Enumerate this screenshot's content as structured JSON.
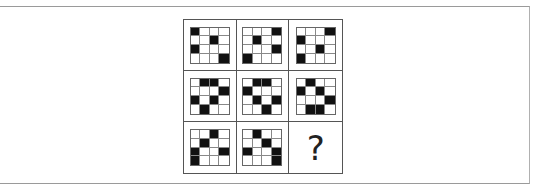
{
  "puzzle": {
    "type": "3x3 matrix reasoning",
    "grid_size": 4,
    "cells": [
      {
        "pattern": [
          [
            1,
            0,
            0,
            0
          ],
          [
            0,
            0,
            1,
            0
          ],
          [
            1,
            0,
            0,
            0
          ],
          [
            0,
            0,
            0,
            1
          ]
        ]
      },
      {
        "pattern": [
          [
            0,
            0,
            0,
            1
          ],
          [
            0,
            1,
            0,
            0
          ],
          [
            0,
            0,
            0,
            1
          ],
          [
            1,
            0,
            0,
            0
          ]
        ]
      },
      {
        "pattern": [
          [
            0,
            0,
            0,
            1
          ],
          [
            1,
            0,
            0,
            0
          ],
          [
            0,
            0,
            1,
            0
          ],
          [
            1,
            0,
            0,
            0
          ]
        ]
      },
      {
        "pattern": [
          [
            0,
            1,
            1,
            0
          ],
          [
            0,
            0,
            0,
            1
          ],
          [
            1,
            0,
            1,
            0
          ],
          [
            0,
            1,
            0,
            0
          ]
        ]
      },
      {
        "pattern": [
          [
            0,
            1,
            1,
            0
          ],
          [
            1,
            0,
            0,
            0
          ],
          [
            0,
            1,
            0,
            1
          ],
          [
            0,
            0,
            1,
            0
          ]
        ]
      },
      {
        "pattern": [
          [
            0,
            1,
            0,
            0
          ],
          [
            1,
            0,
            1,
            0
          ],
          [
            0,
            0,
            0,
            1
          ],
          [
            0,
            1,
            1,
            0
          ]
        ]
      },
      {
        "pattern": [
          [
            0,
            0,
            1,
            0
          ],
          [
            0,
            1,
            0,
            0
          ],
          [
            1,
            0,
            0,
            1
          ],
          [
            1,
            0,
            0,
            0
          ]
        ]
      },
      {
        "pattern": [
          [
            0,
            1,
            0,
            0
          ],
          [
            0,
            0,
            1,
            0
          ],
          [
            1,
            0,
            0,
            1
          ],
          [
            0,
            0,
            0,
            1
          ]
        ]
      },
      {
        "missing": true,
        "label": "?"
      }
    ],
    "colors": {
      "filled": "#111111",
      "empty": "#ffffff",
      "grid_line": "#555555"
    }
  }
}
